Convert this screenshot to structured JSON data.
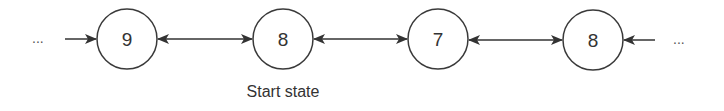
{
  "diagram": {
    "type": "state-chain",
    "nodes": [
      {
        "id": "n1",
        "label": "9",
        "cx": 127,
        "cy": 39
      },
      {
        "id": "n2",
        "label": "8",
        "cx": 283,
        "cy": 39
      },
      {
        "id": "n3",
        "label": "7",
        "cx": 438,
        "cy": 39
      },
      {
        "id": "n4",
        "label": "8",
        "cx": 593,
        "cy": 40
      }
    ],
    "node_radius": 30,
    "edges": [
      {
        "from": "left-ellipsis",
        "to": "n1",
        "direction": "forward"
      },
      {
        "from": "n1",
        "to": "n2",
        "direction": "bidirectional"
      },
      {
        "from": "n2",
        "to": "n3",
        "direction": "bidirectional"
      },
      {
        "from": "n3",
        "to": "n4",
        "direction": "bidirectional"
      },
      {
        "from": "right-ellipsis",
        "to": "n4",
        "direction": "forward"
      }
    ],
    "left_ellipsis": "...",
    "right_ellipsis": "...",
    "caption": "Start state",
    "caption_target": "n2",
    "colors": {
      "stroke": "#333333",
      "background": "#ffffff"
    }
  }
}
